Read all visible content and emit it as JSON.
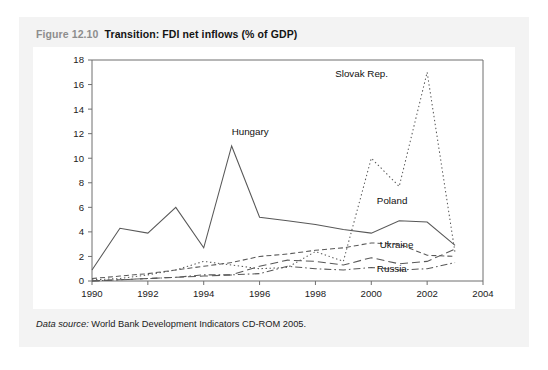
{
  "figure": {
    "number": "Figure 12.10",
    "title": "Transition: FDI net inflows (% of GDP)",
    "source_label": "Data source:",
    "source_text": "World Bank Development Indicators CD-ROM 2005.",
    "panel_bg": "#f3f3f3",
    "plot_bg": "#ffffff",
    "axis_color": "#6f6f6f",
    "line_color": "#585858"
  },
  "chart_data": {
    "type": "line",
    "title": "Transition: FDI net inflows (% of GDP)",
    "xlabel": "",
    "ylabel": "",
    "xlim": [
      1990,
      2004
    ],
    "ylim": [
      0,
      18
    ],
    "xticks": [
      1990,
      1992,
      1994,
      1996,
      1998,
      2000,
      2002,
      2004
    ],
    "yticks": [
      0,
      2,
      4,
      6,
      8,
      10,
      12,
      14,
      16,
      18
    ],
    "grid": false,
    "legend": "inline-annotations",
    "x": [
      1990,
      1991,
      1992,
      1993,
      1994,
      1995,
      1996,
      1997,
      1998,
      1999,
      2000,
      2001,
      2002,
      2003
    ],
    "series": [
      {
        "name": "Hungary",
        "dash": "solid",
        "label_x": 1995.0,
        "label_y": 11.9,
        "values": [
          0.9,
          4.3,
          3.9,
          6.0,
          2.7,
          11.0,
          5.2,
          4.9,
          4.6,
          4.2,
          3.9,
          4.9,
          4.8,
          2.9
        ]
      },
      {
        "name": "Slovak Rep.",
        "dash": "dotted",
        "label_x": 2000.6,
        "label_y": 16.6,
        "values": [
          0.1,
          0.2,
          0.5,
          0.9,
          1.6,
          1.3,
          1.0,
          1.1,
          2.4,
          1.6,
          10.0,
          7.7,
          17.0,
          2.3
        ]
      },
      {
        "name": "Poland",
        "dash": "dashed",
        "label_x": 2000.2,
        "label_y": 6.3,
        "values": [
          0.2,
          0.4,
          0.6,
          0.9,
          1.2,
          1.5,
          2.0,
          2.2,
          2.5,
          2.7,
          3.1,
          3.0,
          2.1,
          2.0
        ]
      },
      {
        "name": "Ukraine",
        "dash": "longdash",
        "label_x": 2000.3,
        "label_y": 2.7,
        "values": [
          0.0,
          0.1,
          0.2,
          0.3,
          0.4,
          0.5,
          1.2,
          1.7,
          1.6,
          1.3,
          1.9,
          1.4,
          1.6,
          2.6
        ]
      },
      {
        "name": "Russia",
        "dash": "dashdot",
        "label_x": 2000.2,
        "label_y": 0.75,
        "values": [
          0.0,
          0.1,
          0.2,
          0.3,
          0.5,
          0.5,
          0.6,
          1.2,
          1.0,
          0.9,
          1.1,
          0.9,
          1.0,
          1.5
        ]
      }
    ]
  }
}
